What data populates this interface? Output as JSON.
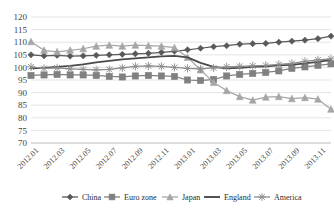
{
  "chart_data": {
    "type": "line",
    "title": "",
    "subtitle": "",
    "xlabel": "",
    "ylabel": "",
    "ylim": [
      70,
      120
    ],
    "ytick_step": 5,
    "yticks": [
      120,
      115,
      110,
      105,
      100,
      95,
      90,
      85,
      80,
      75,
      70
    ],
    "grid": true,
    "legend_position": "bottom",
    "x": [
      "2012.01",
      "2012.02",
      "2012.03",
      "2012.04",
      "2012.05",
      "2012.06",
      "2012.07",
      "2012.08",
      "2012.09",
      "2012.10",
      "2012.11",
      "2012.12",
      "2013.01",
      "2013.02",
      "2013.03",
      "2013.04",
      "2013.05",
      "2013.06",
      "2013.07",
      "2013.08",
      "2013.09",
      "2013.10",
      "2013.11",
      "2013.12"
    ],
    "xticks": [
      "2012.01",
      "2012.03",
      "2012.05",
      "2012.07",
      "2012.09",
      "2012.11",
      "2013.01",
      "2013.03",
      "2013.05",
      "2013.07",
      "2013.09",
      "2013.11"
    ],
    "series": [
      {
        "name": "China",
        "marker": "diamond",
        "color": "#595959",
        "values": [
          105.0,
          104.6,
          104.8,
          104.5,
          104.6,
          104.8,
          105.0,
          105.2,
          105.4,
          105.6,
          106.0,
          106.4,
          107.0,
          107.6,
          108.2,
          108.6,
          109.2,
          109.4,
          109.5,
          110.0,
          110.4,
          110.8,
          111.4,
          112.4
        ]
      },
      {
        "name": "Euro zone",
        "marker": "square",
        "color": "#808080",
        "values": [
          96.8,
          97.0,
          97.2,
          97.0,
          97.0,
          96.8,
          96.4,
          96.2,
          96.6,
          96.8,
          96.6,
          96.4,
          95.0,
          94.8,
          95.2,
          96.6,
          97.2,
          97.6,
          98.0,
          98.6,
          99.6,
          100.2,
          100.8,
          101.4
        ]
      },
      {
        "name": "Japan",
        "marker": "triangle",
        "color": "#a6a6a6",
        "values": [
          110.2,
          106.8,
          106.2,
          106.8,
          107.4,
          108.4,
          108.8,
          108.4,
          108.8,
          108.6,
          108.4,
          107.8,
          104.0,
          99.0,
          94.0,
          90.8,
          88.4,
          87.0,
          88.2,
          88.4,
          87.6,
          88.0,
          87.4,
          83.4
        ]
      },
      {
        "name": "England",
        "marker": "none",
        "color": "#4a4a4a",
        "values": [
          99.6,
          99.8,
          100.2,
          100.6,
          101.2,
          102.0,
          102.6,
          103.2,
          103.6,
          104.0,
          104.4,
          104.6,
          104.0,
          101.8,
          100.2,
          99.6,
          99.8,
          100.2,
          100.4,
          100.8,
          101.0,
          101.6,
          102.2,
          103.0
        ]
      },
      {
        "name": "America",
        "marker": "star",
        "color": "#8c8c8c",
        "values": [
          100.2,
          99.6,
          99.8,
          99.4,
          99.2,
          99.0,
          99.2,
          99.8,
          100.4,
          100.6,
          100.4,
          100.0,
          99.6,
          99.4,
          99.8,
          100.2,
          100.4,
          100.6,
          100.8,
          101.2,
          101.6,
          102.4,
          103.0,
          103.4
        ]
      }
    ]
  },
  "legend": {
    "items": [
      {
        "label": "China"
      },
      {
        "label": "Euro zone"
      },
      {
        "label": "Japan"
      },
      {
        "label": "England"
      },
      {
        "label": "America"
      }
    ]
  }
}
